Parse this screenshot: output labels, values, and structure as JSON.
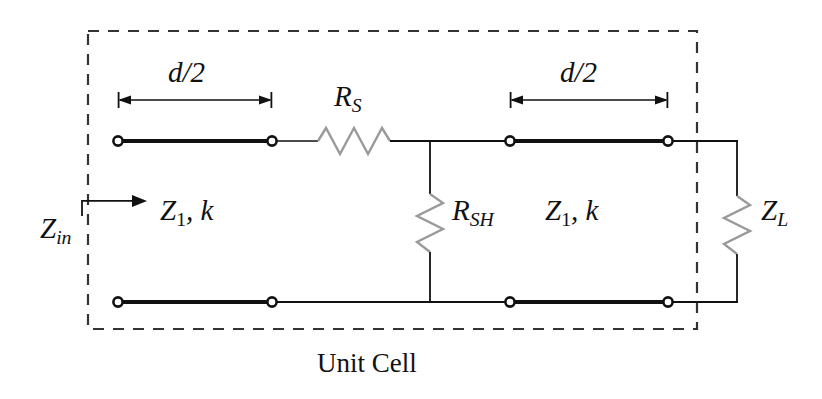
{
  "figure": {
    "type": "circuit-schematic",
    "caption": "Unit Cell",
    "background_color": "#ffffff",
    "line_color": "#111111",
    "resistor_color": "#9a9a9a",
    "dashed_box_color": "#333333"
  },
  "labels": {
    "dim_left": "d/2",
    "dim_right": "d/2",
    "series_resistor": "R",
    "series_resistor_sub": "S",
    "shunt_resistor": "R",
    "shunt_resistor_sub": "SH",
    "load_impedance": "Z",
    "load_impedance_sub": "L",
    "input_impedance": "Z",
    "input_impedance_sub": "in",
    "line_left": "Z",
    "line_left_sub": "1",
    "line_left_tail": ", k",
    "line_right": "Z",
    "line_right_sub": "1",
    "line_right_tail": ", k",
    "unit_cell": "Unit Cell"
  },
  "components": [
    {
      "name": "transmission-line-left",
      "label": "Z1, k",
      "length": "d/2"
    },
    {
      "name": "series-resistor",
      "label": "RS"
    },
    {
      "name": "shunt-resistor",
      "label": "RSH"
    },
    {
      "name": "transmission-line-right",
      "label": "Z1, k",
      "length": "d/2"
    },
    {
      "name": "load-impedance",
      "label": "ZL"
    },
    {
      "name": "input-impedance-port",
      "label": "Zin"
    }
  ],
  "geometry": {
    "dashed_box": {
      "x": 88,
      "y": 31,
      "width": 609,
      "height": 298
    },
    "top_rail_y": 141,
    "bottom_rail_y": 302,
    "dim_arrow_left": {
      "x1": 118,
      "x2": 272,
      "y": 100
    },
    "dim_arrow_right": {
      "x1": 510,
      "x2": 668,
      "y": 100
    },
    "shunt_branch_x": 430,
    "load_branch_x": 737
  }
}
